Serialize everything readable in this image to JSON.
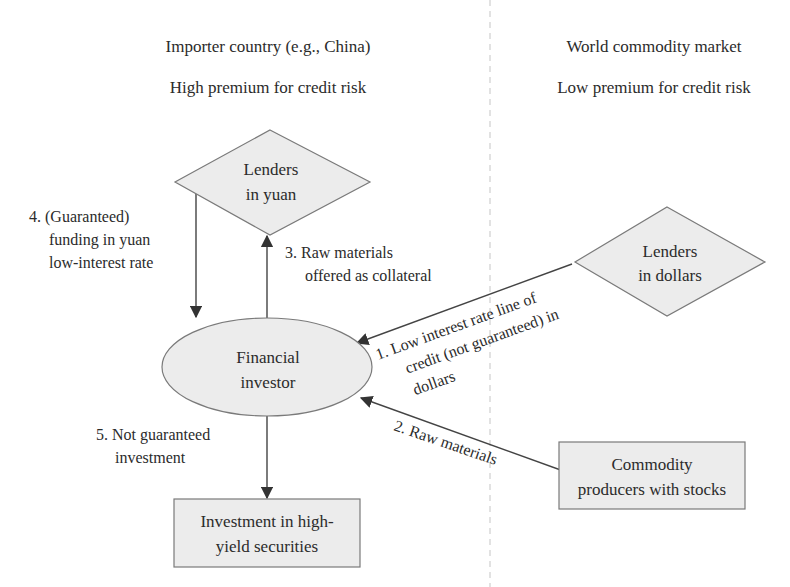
{
  "columns": {
    "left": {
      "title": "Importer country (e.g., China)",
      "subtitle": "High premium for credit risk"
    },
    "right": {
      "title": "World commodity market",
      "subtitle": "Low premium for credit risk"
    }
  },
  "nodes": {
    "lenders_yuan": {
      "line1": "Lenders",
      "line2": "in yuan",
      "shape": "diamond"
    },
    "lenders_dollars": {
      "line1": "Lenders",
      "line2": "in dollars",
      "shape": "diamond"
    },
    "financial_investor": {
      "line1": "Financial",
      "line2": "investor",
      "shape": "ellipse"
    },
    "commodity_producers": {
      "line1": "Commodity",
      "line2": "producers with stocks",
      "shape": "rectangle"
    },
    "high_yield": {
      "line1": "Investment in high-",
      "line2": "yield securities",
      "shape": "rectangle"
    }
  },
  "edges": {
    "e1": {
      "line1": "1. Low interest rate line of",
      "line2": "credit (not guaranteed) in",
      "line3": "dollars"
    },
    "e2": {
      "line1": "2. Raw materials"
    },
    "e3": {
      "line1": "3. Raw materials",
      "line2": "offered as collateral"
    },
    "e4": {
      "line1": "4. (Guaranteed)",
      "line2": "funding in yuan",
      "line3": "low-interest rate"
    },
    "e5": {
      "line1": "5. Not guaranteed",
      "line2": "investment"
    }
  },
  "colors": {
    "shape_fill": "#ececec",
    "shape_stroke": "#7a7a7a",
    "divider": "#cfcfcf"
  }
}
